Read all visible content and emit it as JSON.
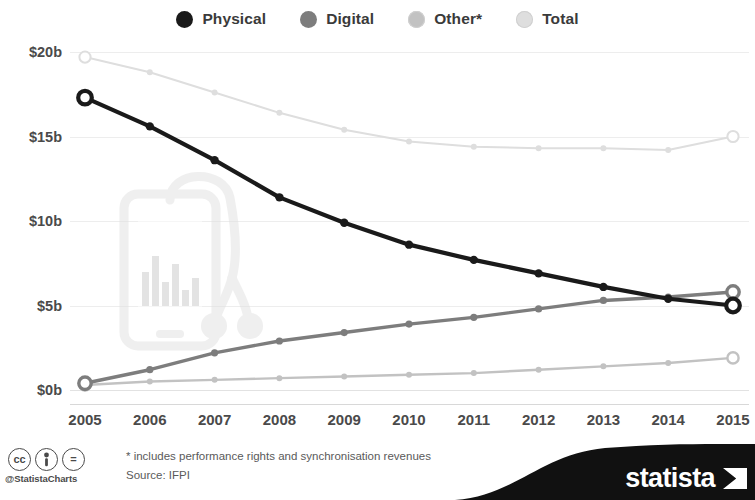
{
  "chart_data": {
    "type": "line",
    "title": "",
    "subtitle": "",
    "xlabel": "",
    "ylabel": "",
    "categories": [
      "2005",
      "2006",
      "2007",
      "2008",
      "2009",
      "2010",
      "2011",
      "2012",
      "2013",
      "2014",
      "2015"
    ],
    "x": [
      2005,
      2006,
      2007,
      2008,
      2009,
      2010,
      2011,
      2012,
      2013,
      2014,
      2015
    ],
    "ylim": [
      0,
      20
    ],
    "ytick_labels": [
      "$0b",
      "$5b",
      "$10b",
      "$15b",
      "$20b"
    ],
    "ytick_values": [
      0,
      5,
      10,
      15,
      20
    ],
    "grid": true,
    "legend_position": "top-center",
    "series": [
      {
        "name": "Physical",
        "color": "#1a1a1a",
        "values": [
          17.3,
          15.6,
          13.6,
          11.4,
          9.9,
          8.6,
          7.7,
          6.9,
          6.1,
          5.4,
          5.0
        ]
      },
      {
        "name": "Digital",
        "color": "#7d7d7d",
        "values": [
          0.4,
          1.2,
          2.2,
          2.9,
          3.4,
          3.9,
          4.3,
          4.8,
          5.3,
          5.5,
          5.8
        ]
      },
      {
        "name": "Other*",
        "color": "#c2c2c2",
        "values": [
          0.3,
          0.5,
          0.6,
          0.7,
          0.8,
          0.9,
          1.0,
          1.2,
          1.4,
          1.6,
          1.9
        ]
      },
      {
        "name": "Total",
        "color": "#dedede",
        "values": [
          19.7,
          18.8,
          17.6,
          16.4,
          15.4,
          14.7,
          14.4,
          14.3,
          14.3,
          14.2,
          15.0
        ]
      }
    ]
  },
  "legend": {
    "items": [
      {
        "label": "Physical",
        "color": "#1a1a1a"
      },
      {
        "label": "Digital",
        "color": "#7d7d7d"
      },
      {
        "label": "Other*",
        "color": "#c2c2c2"
      },
      {
        "label": "Total",
        "color": "#dedede"
      }
    ]
  },
  "footer": {
    "cc_badges": [
      "cc",
      "by",
      "="
    ],
    "handle": "@StatistaCharts",
    "footnote": "* includes performance rights and synchronisation revenues",
    "source": "Source: IFPI",
    "brand": "statista"
  },
  "watermark": {
    "name": "smartphone-with-equalizer-and-earbuds",
    "color": "#e0e0e0"
  }
}
